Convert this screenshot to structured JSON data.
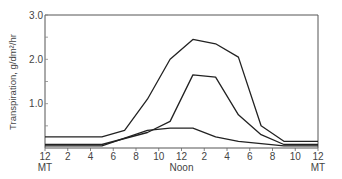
{
  "chart_data": {
    "type": "line",
    "title": "",
    "xlabel": "",
    "ylabel": "Transpiration, g/dm²/hr",
    "ylim": [
      0,
      3.0
    ],
    "xlim": [
      0,
      24
    ],
    "grid": false,
    "legend": "none",
    "y_ticks": [
      "1.0",
      "2.0",
      "3.0"
    ],
    "x_ticks": [
      "12",
      "2",
      "4",
      "6",
      "8",
      "10",
      "12",
      "2",
      "4",
      "6",
      "8",
      "10",
      "12"
    ],
    "x_tick_sublabels": {
      "0": "MT",
      "6": "Noon",
      "12": "MT"
    },
    "series": [
      {
        "name": "upper",
        "x": [
          0,
          5,
          7,
          9,
          11,
          13,
          15,
          17,
          19,
          21,
          24
        ],
        "values": [
          0.25,
          0.25,
          0.4,
          1.1,
          2.0,
          2.45,
          2.35,
          2.05,
          0.5,
          0.15,
          0.15
        ]
      },
      {
        "name": "middle",
        "x": [
          0,
          5,
          9,
          11,
          13,
          15,
          17,
          19,
          21,
          24
        ],
        "values": [
          0.08,
          0.08,
          0.35,
          0.6,
          1.65,
          1.6,
          0.75,
          0.3,
          0.08,
          0.08
        ]
      },
      {
        "name": "lower",
        "x": [
          0,
          5,
          9,
          11,
          13,
          15,
          17,
          21,
          24
        ],
        "values": [
          0.05,
          0.05,
          0.4,
          0.45,
          0.45,
          0.25,
          0.15,
          0.05,
          0.05
        ]
      }
    ]
  }
}
